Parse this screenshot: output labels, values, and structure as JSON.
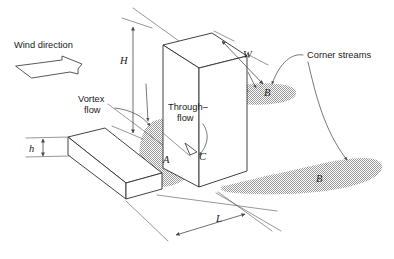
{
  "figure": {
    "background_color": "#ffffff",
    "line_color": "#2e2e2e",
    "shade_color": "#a8a8a8"
  },
  "annotations": {
    "wind_direction": "Wind direction",
    "vortex_flow_line1": "Vortex",
    "vortex_flow_line2": "flow",
    "through_flow_line1": "Through–",
    "through_flow_line2": "flow",
    "corner_streams": "Corner streams"
  },
  "dimensions": {
    "height_tall": "H",
    "width_tall": "W",
    "length_gap": "L",
    "height_low": "h"
  },
  "regions": {
    "vortex_region": "A",
    "corner_stream_near": "B",
    "corner_stream_far": "B",
    "through_flow_region": "C"
  },
  "icons": {
    "wind_arrow": "wind-arrow-icon",
    "through_flow_arrow": "hollow-triangle-arrow-icon"
  }
}
